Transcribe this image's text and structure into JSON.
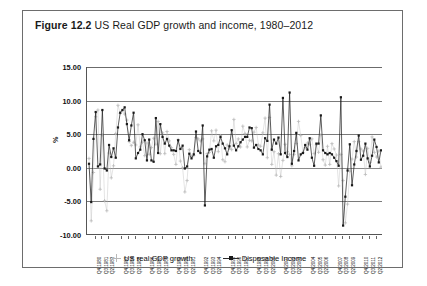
{
  "figure": {
    "label": "Figure 12.2",
    "caption": "US Real GDP growth and income, 1980–2012"
  },
  "legend": {
    "items": [
      {
        "name": "gdp",
        "label": "US real GDP growth",
        "color": "#b9b9b9",
        "marker": "cross"
      },
      {
        "name": "income",
        "label": "Disposable Income",
        "color": "#1a1a1a",
        "marker": "square-line"
      }
    ]
  },
  "chart_data": {
    "type": "line",
    "title": "US Real GDP growth and income, 1980–2012",
    "xlabel": "",
    "ylabel": "%",
    "ylim": [
      -10,
      15
    ],
    "yticks": [
      "15.00",
      "10.00",
      "5.00",
      "0.00",
      "-5.00",
      "-10.00"
    ],
    "ytick_values": [
      15,
      10,
      5,
      0,
      -5,
      -10
    ],
    "grid": true,
    "legend_position": "bottom",
    "x_tick_labels": [
      "Q4 1980",
      "Q3 1981",
      "Q2 1982",
      "Q4 1983",
      "Q3 1984",
      "Q2 1985",
      "Q4 1986",
      "Q3 1987",
      "Q2 1988",
      "Q4 1989",
      "Q3 1990",
      "Q2 1991",
      "Q4 1992",
      "Q3 1993",
      "Q2 1994",
      "Q4 1995",
      "Q3 1996",
      "Q2 1997",
      "Q4 1998",
      "Q3 1999",
      "Q2 2000",
      "Q4 2001",
      "Q3 2002",
      "Q2 2003",
      "Q4 2004",
      "Q3 2005",
      "Q2 2006",
      "Q4 2007",
      "Q3 2008",
      "Q2 2009",
      "Q4 2010",
      "Q3 2011",
      "Q2 2012"
    ],
    "x_tick_indices": [
      3,
      6,
      9,
      15,
      18,
      21,
      27,
      30,
      33,
      39,
      42,
      45,
      51,
      54,
      57,
      63,
      66,
      69,
      75,
      78,
      81,
      87,
      90,
      93,
      99,
      102,
      105,
      111,
      114,
      117,
      123,
      126,
      129
    ],
    "x": [
      "Q1 1980",
      "Q2 1980",
      "Q3 1980",
      "Q4 1980",
      "Q1 1981",
      "Q2 1981",
      "Q3 1981",
      "Q4 1981",
      "Q1 1982",
      "Q2 1982",
      "Q3 1982",
      "Q4 1982",
      "Q1 1983",
      "Q2 1983",
      "Q3 1983",
      "Q4 1983",
      "Q1 1984",
      "Q2 1984",
      "Q3 1984",
      "Q4 1984",
      "Q1 1985",
      "Q2 1985",
      "Q3 1985",
      "Q4 1985",
      "Q1 1986",
      "Q2 1986",
      "Q3 1986",
      "Q4 1986",
      "Q1 1987",
      "Q2 1987",
      "Q3 1987",
      "Q4 1987",
      "Q1 1988",
      "Q2 1988",
      "Q3 1988",
      "Q4 1988",
      "Q1 1989",
      "Q2 1989",
      "Q3 1989",
      "Q4 1989",
      "Q1 1990",
      "Q2 1990",
      "Q3 1990",
      "Q4 1990",
      "Q1 1991",
      "Q2 1991",
      "Q3 1991",
      "Q4 1991",
      "Q1 1992",
      "Q2 1992",
      "Q3 1992",
      "Q4 1992",
      "Q1 1993",
      "Q2 1993",
      "Q3 1993",
      "Q4 1993",
      "Q1 1994",
      "Q2 1994",
      "Q3 1994",
      "Q4 1994",
      "Q1 1995",
      "Q2 1995",
      "Q3 1995",
      "Q4 1995",
      "Q1 1996",
      "Q2 1996",
      "Q3 1996",
      "Q4 1996",
      "Q1 1997",
      "Q2 1997",
      "Q3 1997",
      "Q4 1997",
      "Q1 1998",
      "Q2 1998",
      "Q3 1998",
      "Q4 1998",
      "Q1 1999",
      "Q2 1999",
      "Q3 1999",
      "Q4 1999",
      "Q1 2000",
      "Q2 2000",
      "Q3 2000",
      "Q4 2000",
      "Q1 2001",
      "Q2 2001",
      "Q3 2001",
      "Q4 2001",
      "Q1 2002",
      "Q2 2002",
      "Q3 2002",
      "Q4 2002",
      "Q1 2003",
      "Q2 2003",
      "Q3 2003",
      "Q4 2003",
      "Q1 2004",
      "Q2 2004",
      "Q3 2004",
      "Q4 2004",
      "Q1 2005",
      "Q2 2005",
      "Q3 2005",
      "Q4 2005",
      "Q1 2006",
      "Q2 2006",
      "Q3 2006",
      "Q4 2006",
      "Q1 2007",
      "Q2 2007",
      "Q3 2007",
      "Q4 2007",
      "Q1 2008",
      "Q2 2008",
      "Q3 2008",
      "Q4 2008",
      "Q1 2009",
      "Q2 2009",
      "Q3 2009",
      "Q4 2009",
      "Q1 2010",
      "Q2 2010",
      "Q3 2010",
      "Q4 2010",
      "Q1 2011",
      "Q2 2011",
      "Q3 2011",
      "Q4 2011",
      "Q1 2012",
      "Q2 2012",
      "Q3 2012",
      "Q4 2012"
    ],
    "series": [
      {
        "name": "US real GDP growth",
        "color": "#b9b9b9",
        "marker": "cross",
        "line": false,
        "values": [
          1.4,
          -7.9,
          -0.7,
          7.6,
          8.6,
          -3.2,
          4.9,
          -4.9,
          -6.4,
          2.2,
          -1.5,
          0.3,
          5.1,
          9.3,
          8.1,
          8.5,
          8.0,
          7.1,
          3.9,
          3.3,
          3.8,
          3.4,
          6.4,
          3.1,
          3.8,
          1.8,
          3.7,
          2.0,
          3.0,
          4.4,
          3.5,
          6.9,
          2.1,
          5.2,
          2.1,
          5.4,
          4.0,
          3.0,
          2.0,
          0.5,
          4.2,
          1.0,
          0.0,
          -3.6,
          -1.9,
          2.7,
          1.7,
          1.8,
          4.5,
          4.3,
          4.0,
          4.3,
          0.6,
          2.1,
          2.3,
          5.5,
          4.0,
          5.6,
          2.4,
          4.8,
          1.2,
          0.9,
          3.4,
          2.9,
          2.7,
          7.2,
          3.6,
          4.3,
          3.1,
          6.2,
          5.1,
          3.1,
          4.1,
          4.0,
          5.3,
          6.0,
          3.4,
          3.2,
          5.2,
          7.4,
          1.5,
          7.5,
          0.5,
          2.4,
          -1.1,
          2.1,
          -1.3,
          1.1,
          3.5,
          2.4,
          2.0,
          0.3,
          2.0,
          3.6,
          6.9,
          4.8,
          2.3,
          3.0,
          3.7,
          3.5,
          4.3,
          2.1,
          3.4,
          2.3,
          4.9,
          1.2,
          0.4,
          3.2,
          0.5,
          3.6,
          2.8,
          1.9,
          -2.7,
          2.0,
          -1.9,
          -8.2,
          -5.4,
          -0.5,
          1.3,
          3.9,
          1.6,
          3.9,
          2.8,
          2.5,
          -1.0,
          2.9,
          0.8,
          4.6,
          2.3,
          1.6,
          2.5,
          0.1
        ]
      },
      {
        "name": "Disposable Income",
        "color": "#1a1a1a",
        "marker": "square",
        "line": true,
        "values": [
          0.6,
          -5.1,
          4.3,
          8.3,
          0.2,
          0.5,
          8.6,
          -0.1,
          -0.4,
          3.4,
          1.6,
          2.9,
          1.5,
          6.0,
          8.2,
          8.6,
          9.0,
          6.5,
          4.1,
          6.3,
          8.2,
          1.4,
          2.2,
          2.7,
          5.0,
          4.1,
          1.1,
          4.2,
          1.1,
          0.9,
          7.4,
          2.2,
          6.5,
          4.6,
          3.6,
          4.3,
          3.3,
          2.6,
          2.6,
          2.5,
          4.1,
          2.8,
          3.3,
          -0.1,
          0.2,
          2.1,
          1.4,
          2.0,
          5.4,
          2.5,
          2.2,
          6.3,
          -5.6,
          1.7,
          2.7,
          2.8,
          1.5,
          3.2,
          3.4,
          4.6,
          3.6,
          2.9,
          2.0,
          3.2,
          5.6,
          3.3,
          2.6,
          3.2,
          3.8,
          4.2,
          4.6,
          4.6,
          6.0,
          5.9,
          3.0,
          3.4,
          2.8,
          2.6,
          2.0,
          4.4,
          4.0,
          9.4,
          2.7,
          4.2,
          3.6,
          4.5,
          2.0,
          10.4,
          2.2,
          1.6,
          11.2,
          0.6,
          2.5,
          5.2,
          1.1,
          2.0,
          2.2,
          3.4,
          2.7,
          4.4,
          1.5,
          0.3,
          3.6,
          3.6,
          7.8,
          2.6,
          2.2,
          2.0,
          2.2,
          2.0,
          1.5,
          1.0,
          0.3,
          10.5,
          -8.6,
          -4.3,
          -0.4,
          3.5,
          -2.6,
          0.5,
          2.5,
          4.8,
          1.2,
          1.8,
          3.6,
          1.4,
          0.2,
          1.8,
          4.2,
          3.1,
          0.8,
          2.6
        ]
      }
    ]
  }
}
